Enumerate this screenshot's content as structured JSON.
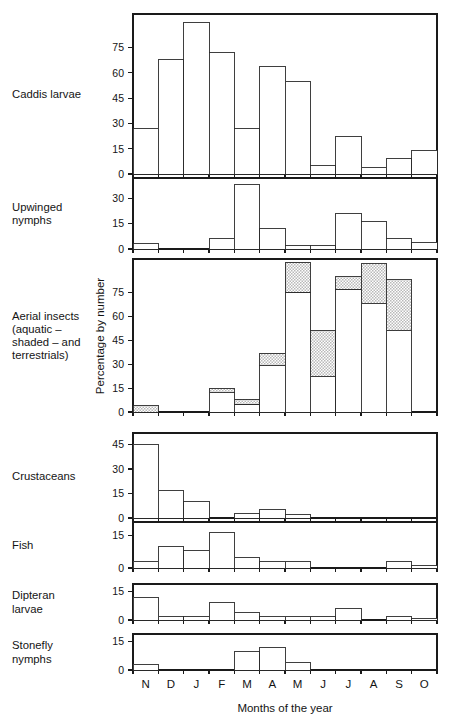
{
  "chart_data": {
    "type": "bar",
    "title": "",
    "xlabel": "Months of the year",
    "ylabel": "Percentage by number",
    "grid": false,
    "legend": "none",
    "legend_note": "aquatic - shaded - and terrestrials",
    "categories": [
      "N",
      "D",
      "J",
      "F",
      "M",
      "A",
      "M",
      "J",
      "J",
      "A",
      "S",
      "O"
    ],
    "panels": [
      {
        "name": "caddis-larvae",
        "label": "Caddis larvae",
        "label_lines": [
          "Caddis larvae"
        ],
        "ylim": [
          0,
          95
        ],
        "yticks": [
          0,
          15,
          30,
          45,
          60,
          75
        ],
        "stacked": false,
        "series": [
          {
            "name": "Caddis larvae",
            "style": "open",
            "values": [
              27,
              68,
              90,
              72,
              27,
              64,
              55,
              5,
              22,
              4,
              9,
              14
            ]
          }
        ]
      },
      {
        "name": "upwinged-nymphs",
        "label": "Upwinged nymphs",
        "label_lines": [
          "Upwinged",
          "nymphs"
        ],
        "ylim": [
          0,
          42
        ],
        "yticks": [
          0,
          15,
          30
        ],
        "stacked": false,
        "series": [
          {
            "name": "Upwinged nymphs",
            "style": "open",
            "values": [
              3,
              0,
              0,
              6,
              38,
              12,
              2,
              2,
              21,
              16,
              6,
              4
            ]
          }
        ]
      },
      {
        "name": "aerial-insects",
        "label": "Aerial insects (aquatic - shaded - and terrestrials)",
        "label_lines": [
          "Aerial insects",
          "(aquatic –",
          "shaded – and",
          "terrestrials)"
        ],
        "ylim": [
          0,
          96
        ],
        "yticks": [
          0,
          15,
          30,
          45,
          60,
          75
        ],
        "stacked": true,
        "series": [
          {
            "name": "aquatic",
            "style": "open",
            "values": [
              0,
              0,
              0,
              12,
              5,
              29,
              75,
              22,
              77,
              68,
              51,
              0
            ]
          },
          {
            "name": "terrestrial (shaded)",
            "style": "shaded",
            "values": [
              4,
              0,
              0,
              3,
              3,
              8,
              19,
              29,
              8,
              25,
              32,
              0
            ]
          }
        ]
      },
      {
        "name": "crustaceans",
        "label": "Crustaceans",
        "label_lines": [
          "Crustaceans"
        ],
        "ylim": [
          0,
          52
        ],
        "yticks": [
          0,
          15,
          30,
          45
        ],
        "stacked": false,
        "series": [
          {
            "name": "Crustaceans",
            "style": "open",
            "values": [
              45,
              17,
              10,
              0,
              3,
              5,
              2,
              0,
              0,
              0,
              0,
              0
            ]
          }
        ]
      },
      {
        "name": "fish",
        "label": "Fish",
        "label_lines": [
          "Fish"
        ],
        "ylim": [
          0,
          21
        ],
        "yticks": [
          0,
          15
        ],
        "stacked": false,
        "series": [
          {
            "name": "Fish",
            "style": "open",
            "values": [
              3,
              10,
              8,
              16,
              5,
              3,
              3,
              0,
              0,
              0,
              3,
              1
            ]
          }
        ]
      },
      {
        "name": "dipteran-larvae",
        "label": "Dipteran larvae",
        "label_lines": [
          "Dipteran",
          "larvae"
        ],
        "ylim": [
          0,
          19
        ],
        "yticks": [
          0,
          15
        ],
        "stacked": false,
        "series": [
          {
            "name": "Dipteran larvae",
            "style": "open",
            "values": [
              12,
              2,
              2,
              9,
              4,
              2,
              2,
              2,
              6,
              0,
              2,
              1
            ]
          }
        ]
      },
      {
        "name": "stonefly-nymphs",
        "label": "Stonefly nymphs",
        "label_lines": [
          "Stonefly",
          "nymphs"
        ],
        "ylim": [
          0,
          19
        ],
        "yticks": [
          0,
          15
        ],
        "stacked": false,
        "series": [
          {
            "name": "Stonefly nymphs",
            "style": "open",
            "values": [
              3,
              0,
              0,
              0,
              10,
              12,
              4,
              0,
              0,
              0,
              0,
              0
            ]
          }
        ]
      }
    ]
  },
  "colors": {
    "ink": "#1a1a1a",
    "bar_fill": "#ffffff",
    "bar_stroke": "#2a2a2a",
    "shade_fill": "#d8d8d8"
  },
  "layout": {
    "plot_left": 133,
    "plot_right": 437,
    "label_x": 12,
    "panels_geometry": [
      {
        "top": 14,
        "bottom": 174
      },
      {
        "top": 178,
        "bottom": 249
      },
      {
        "top": 259,
        "bottom": 412
      },
      {
        "top": 433,
        "bottom": 518
      },
      {
        "top": 522,
        "bottom": 568
      },
      {
        "top": 584,
        "bottom": 620
      },
      {
        "top": 634,
        "bottom": 670
      }
    ],
    "month_label_y": 688,
    "xlabel_y": 712,
    "ylabel_cx": 104,
    "ylabel_cy": 336
  }
}
